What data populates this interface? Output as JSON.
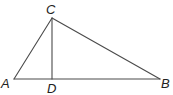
{
  "diagram": {
    "type": "geometry",
    "stroke_color": "#4a4a4a",
    "label_color": "#222222",
    "points": {
      "A": {
        "x": 14,
        "y": 79,
        "label": "A",
        "label_x": 1,
        "label_y": 88
      },
      "B": {
        "x": 160,
        "y": 79,
        "label": "B",
        "label_x": 161,
        "label_y": 88
      },
      "C": {
        "x": 52,
        "y": 18,
        "label": "C",
        "label_x": 46,
        "label_y": 14
      },
      "D": {
        "x": 52,
        "y": 79,
        "label": "D",
        "label_x": 47,
        "label_y": 93
      }
    },
    "segments": [
      {
        "from": "A",
        "to": "C",
        "name": "AC"
      },
      {
        "from": "C",
        "to": "B",
        "name": "CB"
      },
      {
        "from": "A",
        "to": "B",
        "name": "AB"
      },
      {
        "from": "C",
        "to": "D",
        "name": "CD"
      }
    ]
  }
}
